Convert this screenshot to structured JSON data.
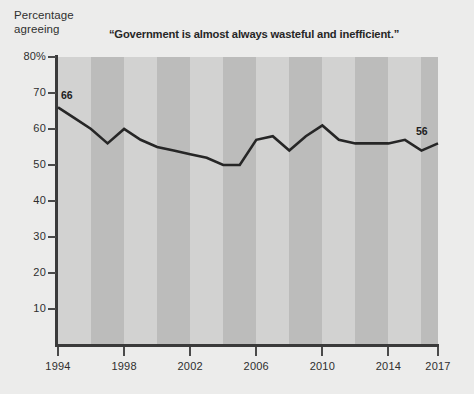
{
  "axis_title": {
    "line1": "Percentage",
    "line2": "agreeing"
  },
  "chart_title": "“Government is almost always wasteful and inefficient.”",
  "colors": {
    "page_background": "#ececeb",
    "band_light": "#d2d2d1",
    "band_dark": "#bcbcbb",
    "axis": "#3a3a3a",
    "line": "#262626",
    "text": "#2e2e2e"
  },
  "chart_data": {
    "type": "line",
    "title": "“Government is almost always wasteful and inefficient.”",
    "xlabel": "",
    "ylabel": "Percentage agreeing",
    "xlim": [
      1994,
      2017
    ],
    "ylim": [
      0,
      80
    ],
    "grid": false,
    "legend": false,
    "bands": "alternating vertical gray stripes, 2 years per band",
    "y_ticks": [
      80,
      70,
      60,
      50,
      40,
      30,
      20,
      10
    ],
    "y_tick_labels": [
      "80%",
      "70",
      "60",
      "50",
      "40",
      "30",
      "20",
      "10"
    ],
    "x_ticks": [
      1994,
      1998,
      2002,
      2006,
      2010,
      2014,
      2017
    ],
    "x_tick_labels": [
      "1994",
      "1998",
      "2002",
      "2006",
      "2010",
      "2014",
      "2017"
    ],
    "series": [
      {
        "name": "Percentage agreeing",
        "x": [
          1994,
          1995,
          1996,
          1997,
          1998,
          1999,
          2000,
          2001,
          2002,
          2003,
          2004,
          2005,
          2006,
          2007,
          2008,
          2009,
          2010,
          2011,
          2012,
          2013,
          2014,
          2015,
          2016,
          2017
        ],
        "values": [
          66,
          63,
          60,
          56,
          60,
          57,
          55,
          54,
          53,
          52,
          50,
          50,
          57,
          58,
          54,
          58,
          61,
          57,
          56,
          56,
          56,
          57,
          54,
          56
        ]
      }
    ],
    "annotations": [
      {
        "label": "66",
        "x": 1994,
        "y": 66,
        "position": "above"
      },
      {
        "label": "56",
        "x": 2017,
        "y": 56,
        "position": "above"
      }
    ]
  }
}
